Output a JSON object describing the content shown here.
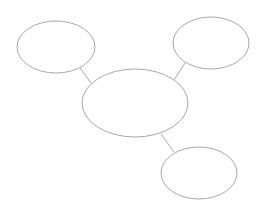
{
  "diagram": {
    "type": "bubble-map",
    "background": "#ffffff",
    "stroke_color": "#a8a8a8",
    "stroke_width": 1,
    "nodes": [
      {
        "id": "center",
        "label": "",
        "cx": 135,
        "cy": 103,
        "rx": 53,
        "ry": 34
      },
      {
        "id": "top-left",
        "label": "",
        "cx": 56,
        "cy": 47,
        "rx": 39,
        "ry": 26
      },
      {
        "id": "top-right",
        "label": "",
        "cx": 211,
        "cy": 43,
        "rx": 38,
        "ry": 26
      },
      {
        "id": "bottom-right",
        "label": "",
        "cx": 199,
        "cy": 173,
        "rx": 38,
        "ry": 26
      }
    ],
    "edges": [
      {
        "from": "center",
        "to": "top-left",
        "x1": 91,
        "y1": 83,
        "x2": 80,
        "y2": 68
      },
      {
        "from": "center",
        "to": "top-right",
        "x1": 174,
        "y1": 80,
        "x2": 185,
        "y2": 63
      },
      {
        "from": "center",
        "to": "bottom-right",
        "x1": 161,
        "y1": 134,
        "x2": 174,
        "y2": 152
      }
    ]
  }
}
